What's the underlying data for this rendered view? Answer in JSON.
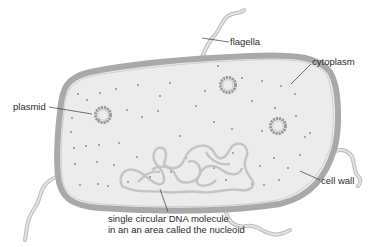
{
  "diagram": {
    "labels": {
      "flagella": "flagella",
      "cytoplasm": "cytoplasm",
      "plasmid": "plasmid",
      "cell_wall": "cell wall",
      "dna_line1": "single circular DNA molecule",
      "dna_line2": "in an an area called the nucleoid"
    },
    "colors": {
      "cell_wall": "#a9a9a9",
      "cytoplasm": "#ececec",
      "flagella": "#d6d6d6",
      "flagella_edge": "#bdbdbd",
      "plasmid": "#9a9a9a",
      "dna": "#c4c4c4",
      "ribosome_dots": "#8f8f8f",
      "leader_lines": "#3a3a3a",
      "text": "#2b2b2b"
    }
  }
}
